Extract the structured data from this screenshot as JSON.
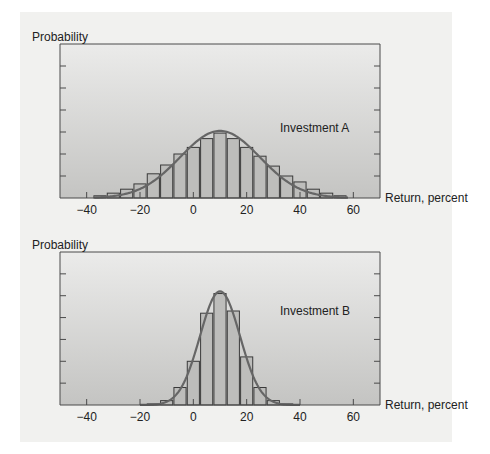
{
  "colors": {
    "page_background": "#f1f1ef",
    "plot_gradient_top": "#ebebea",
    "plot_gradient_bottom": "#c4c4c2",
    "bar_fill": "#bdbdbb",
    "bar_stroke": "#3a3a3a",
    "curve": "#666666",
    "axis": "#4a4a4a",
    "text": "#222222"
  },
  "chart_data": [
    {
      "type": "bar",
      "title": "Investment A",
      "annotation": "Investment A",
      "xlabel": "Return, percent",
      "ylabel": "Probability",
      "xlim": [
        -50,
        70
      ],
      "ylim": [
        0,
        7
      ],
      "x_ticks": [
        -40,
        -20,
        0,
        20,
        40,
        60
      ],
      "x_tick_labels": [
        "−40",
        "−20",
        "0",
        "20",
        "40",
        "60"
      ],
      "y_ticks": [
        1,
        2,
        3,
        4,
        5,
        6
      ],
      "y_tick_labels": [],
      "bar_width": 5,
      "categories": [
        -35,
        -30,
        -25,
        -20,
        -15,
        -10,
        -5,
        0,
        5,
        10,
        15,
        20,
        25,
        30,
        35,
        40,
        45,
        50,
        55
      ],
      "values": [
        0.1,
        0.22,
        0.4,
        0.64,
        1.1,
        1.5,
        2.0,
        2.3,
        2.7,
        2.95,
        2.7,
        2.3,
        1.9,
        1.45,
        1.0,
        0.73,
        0.4,
        0.22,
        0.1
      ],
      "curve": {
        "type": "normal",
        "mean": 10,
        "sd": 15,
        "peak": 3.05,
        "x_range": [
          -37,
          58
        ]
      },
      "grid": false
    },
    {
      "type": "bar",
      "title": "Investment B",
      "annotation": "Investment B",
      "xlabel": "Return, percent",
      "ylabel": "Probability",
      "xlim": [
        -50,
        70
      ],
      "ylim": [
        0,
        7
      ],
      "x_ticks": [
        -40,
        -20,
        0,
        20,
        40,
        60
      ],
      "x_tick_labels": [
        "−40",
        "−20",
        "0",
        "20",
        "40",
        "60"
      ],
      "y_ticks": [
        1,
        2,
        3,
        4,
        5,
        6
      ],
      "y_tick_labels": [],
      "bar_width": 5,
      "categories": [
        -15,
        -10,
        -5,
        0,
        5,
        10,
        15,
        20,
        25,
        30,
        35
      ],
      "values": [
        0.05,
        0.2,
        0.8,
        2.0,
        4.2,
        5.1,
        4.3,
        2.2,
        0.8,
        0.2,
        0.05
      ],
      "curve": {
        "type": "normal",
        "mean": 10,
        "sd": 7.5,
        "peak": 5.2,
        "x_range": [
          -20,
          40
        ]
      },
      "grid": false
    }
  ]
}
